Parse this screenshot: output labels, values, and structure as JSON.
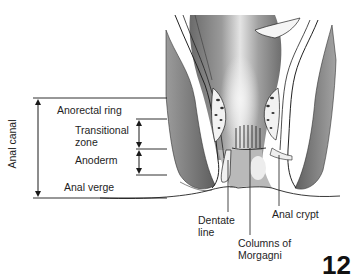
{
  "figure": {
    "vertical_label": "Anal canal",
    "zones": [
      {
        "key": "anorectal_ring",
        "label": "Anorectal ring"
      },
      {
        "key": "transitional_zone",
        "label_line1": "Transitional",
        "label_line2": "zone"
      },
      {
        "key": "anoderm",
        "label": "Anoderm"
      },
      {
        "key": "anal_verge",
        "label": "Anal verge"
      }
    ],
    "callouts": [
      {
        "key": "dentate_line",
        "label_line1": "Dentate",
        "label_line2": "line"
      },
      {
        "key": "columns_of_morgagni",
        "label_line1": "Columns of",
        "label_line2": "Morgagni"
      },
      {
        "key": "anal_crypt",
        "label": "Anal crypt"
      }
    ],
    "figure_number": "12"
  },
  "colors": {
    "line": "#1a1a1a",
    "tissue_dark": "#5a5a5a",
    "tissue_mid": "#8c8c8c",
    "tissue_light": "#d6d6d6",
    "background": "#ffffff"
  }
}
